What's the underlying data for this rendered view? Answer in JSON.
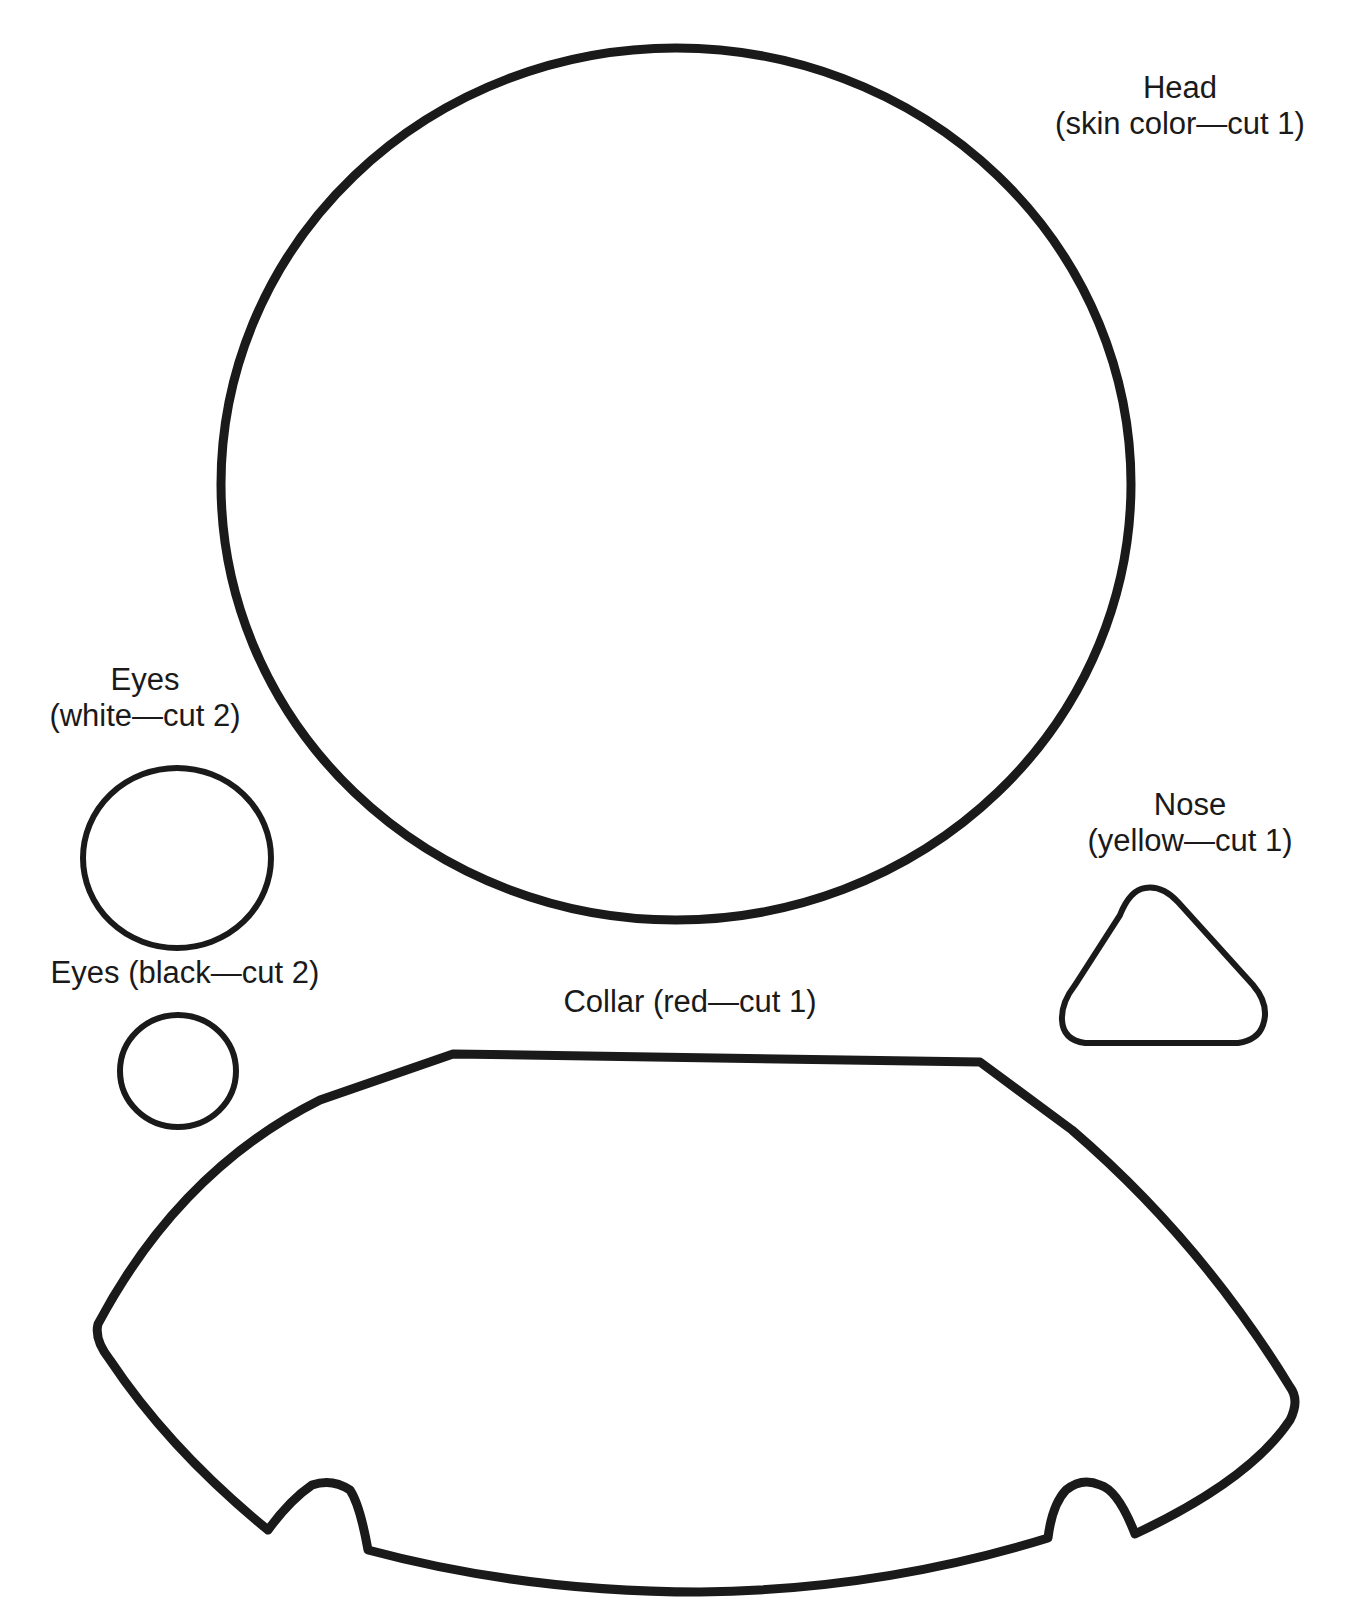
{
  "pieces": {
    "head": {
      "name": "Head",
      "instruction": "(skin color—cut 1)"
    },
    "eyes_white": {
      "name": "Eyes",
      "instruction": "(white—cut 2)"
    },
    "eyes_black": {
      "label": "Eyes (black—cut 2)"
    },
    "nose": {
      "name": "Nose",
      "instruction": "(yellow—cut 1)"
    },
    "collar": {
      "label": "Collar (red—cut 1)"
    }
  },
  "colors": {
    "outline": "#1a1a1a",
    "background": "#ffffff"
  }
}
